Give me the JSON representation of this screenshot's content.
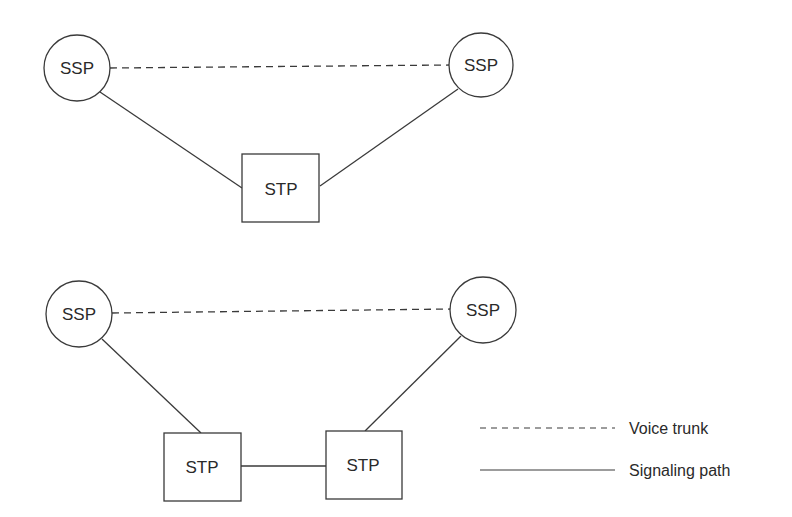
{
  "diagram": {
    "top": {
      "nodes": [
        {
          "id": "ssp-left",
          "type": "circle",
          "label": "SSP",
          "cx": 77,
          "cy": 68,
          "r": 33
        },
        {
          "id": "ssp-right",
          "type": "circle",
          "label": "SSP",
          "cx": 481,
          "cy": 65,
          "r": 32
        },
        {
          "id": "stp",
          "type": "box",
          "label": "STP",
          "x": 242,
          "y": 154,
          "w": 77,
          "h": 68
        }
      ]
    },
    "bottom": {
      "nodes": [
        {
          "id": "ssp-left",
          "type": "circle",
          "label": "SSP",
          "cx": 79,
          "cy": 314,
          "r": 33
        },
        {
          "id": "ssp-right",
          "type": "circle",
          "label": "SSP",
          "cx": 483,
          "cy": 310,
          "r": 33
        },
        {
          "id": "stp-left",
          "type": "box",
          "label": "STP",
          "x": 164,
          "y": 433,
          "w": 77,
          "h": 68
        },
        {
          "id": "stp-right",
          "type": "box",
          "label": "STP",
          "x": 326,
          "y": 431,
          "w": 76,
          "h": 68
        }
      ]
    },
    "legend": {
      "items": [
        {
          "style": "dashed",
          "label": "Voice trunk"
        },
        {
          "style": "solid",
          "label": "Signaling path"
        }
      ]
    }
  },
  "labels": {
    "ssp": "SSP",
    "stp": "STP",
    "voice_trunk": "Voice trunk",
    "signaling_path": "Signaling path"
  },
  "colors": {
    "stroke": "#3a3a3a",
    "text": "#2a2a2a",
    "background": "#ffffff"
  }
}
